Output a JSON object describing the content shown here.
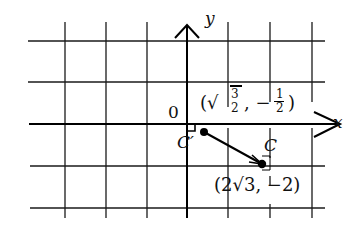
{
  "diagram": {
    "type": "coordinate-plane",
    "axes": {
      "x_label": "x",
      "y_label": "y",
      "origin_label": "0"
    },
    "grid": {
      "columns_x_px": [
        65,
        106,
        147,
        187,
        228,
        270,
        312
      ],
      "rows_y_px": [
        41,
        82,
        124,
        166,
        208
      ]
    },
    "points": [
      {
        "name": "C'",
        "label": "C′",
        "coords_label": "(√3/2, −1/2)",
        "sqrt_num": "3",
        "den": "2",
        "neg_num": "1"
      },
      {
        "name": "C",
        "label": "C",
        "coords_label": "(2√3, −2)",
        "coef": "2",
        "radicand": "3",
        "y": "−2"
      }
    ],
    "segment": {
      "from": "C'",
      "to": "C",
      "arrow": "toward C"
    }
  },
  "text": {
    "y": "y",
    "x": "x",
    "zero": "0",
    "cprime": "C′",
    "c": "C",
    "cprime_open": "(√",
    "cprime_num": "3",
    "cprime_den": "2",
    "cprime_mid": ", −",
    "cprime_num2": "1",
    "cprime_den2": "2",
    "cprime_close": ")",
    "c_coord": "(2√3, −2)"
  }
}
